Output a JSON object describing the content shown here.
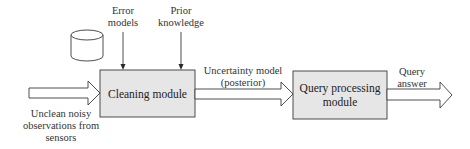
{
  "diagram": {
    "nodes": {
      "cleaning": {
        "label": "Cleaning module"
      },
      "query_processing": {
        "label": "Query processing module",
        "line1": "Query processing",
        "line2": "module"
      },
      "database": {
        "icon": "database-cylinder-icon"
      }
    },
    "inputs": {
      "error_models": {
        "line1": "Error",
        "line2": "models"
      },
      "prior_knowledge": {
        "line1": "Prior",
        "line2": "knowledge"
      },
      "sensor_observations": {
        "line1": "Unclean noisy",
        "line2": "observations from",
        "line3": "sensors"
      }
    },
    "edges": {
      "uncertainty_model": {
        "line1": "Uncertainty model",
        "line2": "(posterior)"
      },
      "query_answer": {
        "line1": "Query",
        "line2": "answer"
      }
    },
    "colors": {
      "box_fill": "#e6e6e6",
      "stroke": "#3a3a3a",
      "background": "#ffffff"
    }
  }
}
